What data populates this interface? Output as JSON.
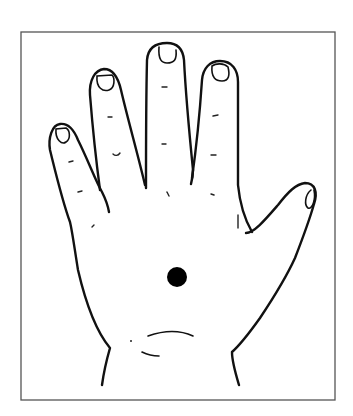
{
  "figure": {
    "frame": {
      "x": 20,
      "y": 32,
      "width": 315,
      "height": 368,
      "stroke": "#555555"
    },
    "marker": {
      "label": "palm-center-point",
      "cx": 177,
      "cy": 277,
      "r": 10,
      "color": "#000000"
    },
    "line_color": "#111111",
    "background": "#ffffff"
  }
}
